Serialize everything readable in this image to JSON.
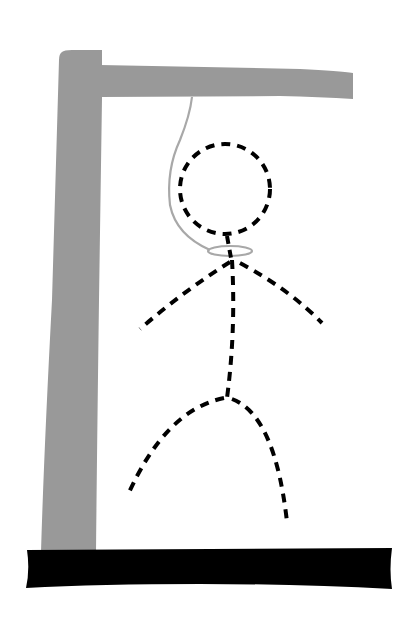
{
  "illustration": {
    "subject": "hangman-drawing",
    "colors": {
      "background": "#ffffff",
      "gallows": "#999999",
      "rope": "#a8a8a8",
      "figure": "#000000",
      "base": "#000000"
    },
    "parts": [
      "gallows-post",
      "gallows-beam",
      "base-platform",
      "rope",
      "noose",
      "head",
      "body",
      "left-arm",
      "right-arm",
      "left-leg",
      "right-leg"
    ]
  }
}
